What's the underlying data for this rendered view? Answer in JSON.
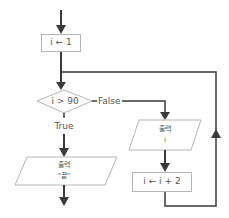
{
  "diagram": {
    "type": "flowchart",
    "nodes": [
      {
        "id": "init",
        "shape": "process",
        "text": "i ← 1"
      },
      {
        "id": "cond",
        "shape": "decision",
        "text": "i > 90"
      },
      {
        "id": "out_end",
        "shape": "io",
        "line1": "출력",
        "line2": "\"끝\""
      },
      {
        "id": "out_i",
        "shape": "io",
        "line1": "출력",
        "line2": "i"
      },
      {
        "id": "incr",
        "shape": "process",
        "text": "i ← i + 2"
      }
    ],
    "edges": [
      {
        "from": "start",
        "to": "init",
        "label": ""
      },
      {
        "from": "init",
        "to": "cond",
        "label": ""
      },
      {
        "from": "cond",
        "to": "out_end",
        "label": "True"
      },
      {
        "from": "cond",
        "to": "out_i",
        "label": "False"
      },
      {
        "from": "out_i",
        "to": "incr",
        "label": ""
      },
      {
        "from": "incr",
        "to": "cond",
        "label": "",
        "note": "loop back"
      },
      {
        "from": "out_end",
        "to": "end",
        "label": ""
      }
    ]
  },
  "colors": {
    "line": "#3a3a3a",
    "shape_border": "#b5b5b5",
    "text": "#555555"
  }
}
